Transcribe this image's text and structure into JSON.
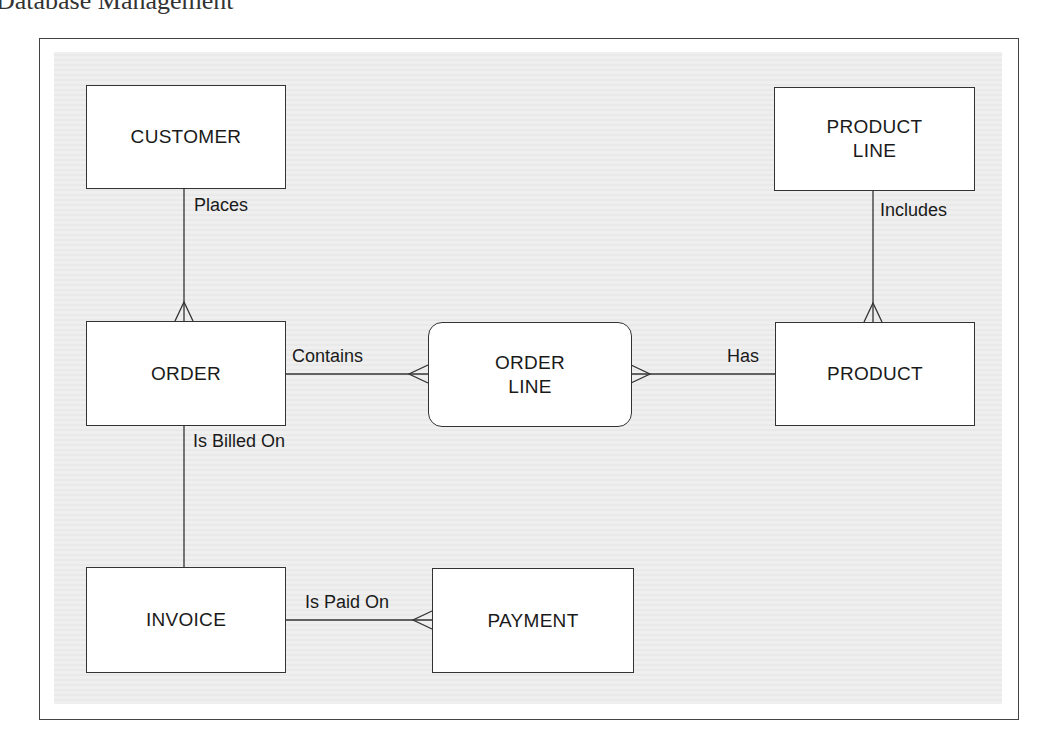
{
  "page": {
    "title": "Database Management"
  },
  "diagram": {
    "type": "entity-relationship",
    "entities": [
      {
        "id": "customer",
        "label": "CUSTOMER",
        "line1": "CUSTOMER",
        "line2": ""
      },
      {
        "id": "order",
        "label": "ORDER",
        "line1": "ORDER",
        "line2": ""
      },
      {
        "id": "invoice",
        "label": "INVOICE",
        "line1": "INVOICE",
        "line2": ""
      },
      {
        "id": "payment",
        "label": "PAYMENT",
        "line1": "PAYMENT",
        "line2": ""
      },
      {
        "id": "order-line",
        "label": "ORDER LINE",
        "line1": "ORDER",
        "line2": "LINE",
        "style": "rounded (associative)"
      },
      {
        "id": "product",
        "label": "PRODUCT",
        "line1": "PRODUCT",
        "line2": ""
      },
      {
        "id": "product-line",
        "label": "PRODUCT LINE",
        "line1": "PRODUCT",
        "line2": "LINE"
      }
    ],
    "relationships": [
      {
        "label": "Places",
        "from": "CUSTOMER",
        "to": "ORDER",
        "cardinality": "one-to-many"
      },
      {
        "label": "Contains",
        "from": "ORDER",
        "to": "ORDER LINE",
        "cardinality": "one-to-many"
      },
      {
        "label": "Has",
        "from": "PRODUCT",
        "to": "ORDER LINE",
        "cardinality": "one-to-many"
      },
      {
        "label": "Includes",
        "from": "PRODUCT LINE",
        "to": "PRODUCT",
        "cardinality": "one-to-many"
      },
      {
        "label": "Is Billed On",
        "from": "ORDER",
        "to": "INVOICE",
        "cardinality": "one-to-one"
      },
      {
        "label": "Is Paid On",
        "from": "INVOICE",
        "to": "PAYMENT",
        "cardinality": "one-to-many"
      }
    ]
  }
}
